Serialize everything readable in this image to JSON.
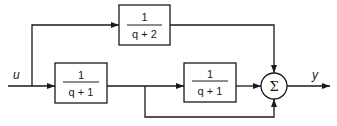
{
  "diagram": {
    "type": "block-diagram",
    "input_label": "u",
    "output_label": "y",
    "blocks": [
      {
        "id": "G_top",
        "numerator": "1",
        "denominator": "q + 2"
      },
      {
        "id": "G1",
        "numerator": "1",
        "denominator": "q + 1"
      },
      {
        "id": "G2",
        "numerator": "1",
        "denominator": "q + 1"
      }
    ],
    "summing_junction": {
      "symbol": "Σ",
      "inputs": 3
    },
    "connections": [
      {
        "from": "u",
        "to": "G_top"
      },
      {
        "from": "u",
        "to": "G1"
      },
      {
        "from": "G1",
        "to": "G2"
      },
      {
        "from": "G1",
        "to": "sum"
      },
      {
        "from": "G_top",
        "to": "sum"
      },
      {
        "from": "G2",
        "to": "sum"
      },
      {
        "from": "sum",
        "to": "y"
      }
    ],
    "colors": {
      "stroke": "#1a1a1a",
      "background": "#ffffff"
    }
  }
}
